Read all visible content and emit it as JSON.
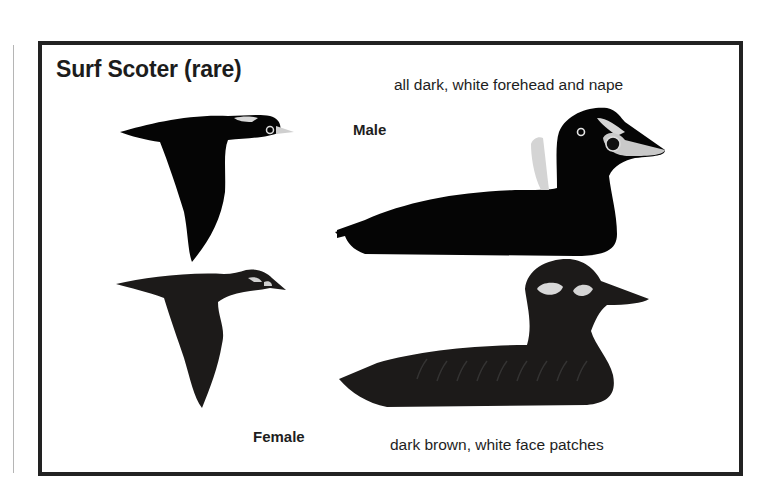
{
  "plate": {
    "title": "Surf Scoter (rare)",
    "male": {
      "label": "Male",
      "description": "all dark, white forehead and nape",
      "figures": [
        "male-flying-illustration",
        "male-swimming-illustration"
      ]
    },
    "female": {
      "label": "Female",
      "description": "dark brown, white face patches",
      "figures": [
        "female-flying-illustration",
        "female-swimming-illustration"
      ]
    }
  },
  "colors": {
    "frame": "#222222",
    "male_plumage": "#050505",
    "female_plumage": "#1c1a19",
    "white_patch": "#e8e8e8",
    "bill_male": "#c9c9c9",
    "background": "#ffffff"
  }
}
